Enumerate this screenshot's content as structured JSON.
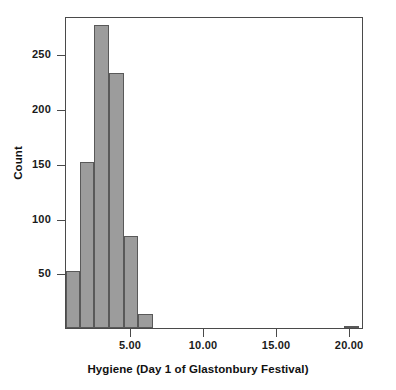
{
  "chart_data": {
    "type": "bar",
    "title": "",
    "subtitle": "",
    "xlabel": "Hygiene (Day 1 of Glastonbury Festival)",
    "ylabel": "Count",
    "xlim": [
      0.55,
      20.95
    ],
    "ylim": [
      0,
      285
    ],
    "grid": false,
    "legend": null,
    "bin_width": 1,
    "xticks": [
      5.0,
      10.0,
      15.0,
      20.0
    ],
    "xtick_labels": [
      "5.00",
      "10.00",
      "15.00",
      "20.00"
    ],
    "yticks": [
      50,
      100,
      150,
      200,
      250
    ],
    "ytick_labels": [
      "50",
      "100",
      "150",
      "200",
      "250"
    ],
    "bar_color": "#9c9c9c",
    "bar_edge_color": "#595959",
    "axis_color": "#4a4a4a",
    "categories": [
      "0.5-1.5",
      "1.5-2.5",
      "2.5-3.5",
      "3.5-4.5",
      "4.5-5.5",
      "5.5-6.5",
      "19.5-20.5"
    ],
    "x": [
      1.0,
      2.0,
      3.0,
      4.0,
      5.0,
      6.0,
      20.0
    ],
    "values": [
      52,
      152,
      277,
      233,
      84,
      13,
      2
    ],
    "bars": [
      {
        "label": "0.5-1.5",
        "x_left": 0.55,
        "x_right": 1.5,
        "value": 52
      },
      {
        "label": "1.5-2.5",
        "x_left": 1.5,
        "x_right": 2.5,
        "value": 152
      },
      {
        "label": "2.5-3.5",
        "x_left": 2.5,
        "x_right": 3.5,
        "value": 277
      },
      {
        "label": "3.5-4.5",
        "x_left": 3.5,
        "x_right": 4.5,
        "value": 233
      },
      {
        "label": "4.5-5.5",
        "x_left": 4.5,
        "x_right": 5.5,
        "value": 84
      },
      {
        "label": "5.5-6.5",
        "x_left": 5.5,
        "x_right": 6.5,
        "value": 13
      },
      {
        "label": "19.5-20.5",
        "x_left": 19.6,
        "x_right": 20.6,
        "value": 2
      }
    ]
  }
}
